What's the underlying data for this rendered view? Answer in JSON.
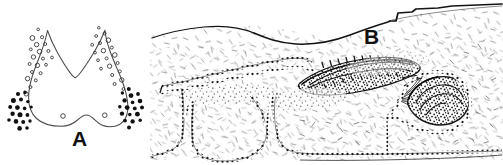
{
  "figure": {
    "background_color": "#ffffff",
    "ink_color": "#1a1a1a",
    "width": 503,
    "height": 165,
    "panels": [
      {
        "id": "A",
        "label": "A",
        "label_position": "bottom-center",
        "type": "schematic-outline-diagram",
        "description": "Bilobed U-shaped / W-shaped sectional outline with a median notch at the top and a shallow median notch at the bottom margin.",
        "markers": {
          "open_circle": {
            "name": "open-circle-marker",
            "count": 34,
            "fill": "none",
            "stroke": "#333333",
            "placement": "along the upper-lateral margins of the outline, following both limbs down to the shoulders",
            "legend_meaning": "open symbol"
          },
          "filled_dot": {
            "name": "filled-dot-marker",
            "count": 36,
            "fill": "#111111",
            "stroke": "none",
            "placement": "two dense clusters outside the lower-left and lower-right flanks of the outline",
            "legend_meaning": "solid symbol"
          }
        }
      },
      {
        "id": "B",
        "label": "B",
        "label_position": "top-left",
        "type": "histological-line-drawing",
        "description": "Stippled tissue section in side view: an upper sloping surface contour with a step at the right, fine hatch texture throughout, three large rounded cavity outlines drawn with beaded (dotted) borders along the lower margin, a long lens-shaped dark stippled structure in the upper centre-right, and a smaller ovoid dark stippled structure to its lower right.",
        "features": [
          {
            "name": "upper-surface-contour",
            "note": "sloping outer boundary rising left to right with a step near the right end"
          },
          {
            "name": "left-cavity-outline",
            "note": "beaded-border rounded cavity, lower left"
          },
          {
            "name": "centre-cavity-outline",
            "note": "beaded-border rounded cavity, lower centre"
          },
          {
            "name": "right-cavity-outline",
            "note": "beaded-border cavity extending to the lower right corner"
          },
          {
            "name": "duct-channel",
            "note": "narrow beaded channel running up-right from the left cavity"
          },
          {
            "name": "lens-shaped-dark-body",
            "note": "elongated densely stippled lens in the upper centre-right"
          },
          {
            "name": "ovoid-dark-body",
            "note": "smaller densely stippled ovoid at the right, below the lens"
          },
          {
            "name": "tissue-hatch-texture",
            "note": "scattered short strokes representing fibrous matrix"
          }
        ]
      }
    ]
  }
}
